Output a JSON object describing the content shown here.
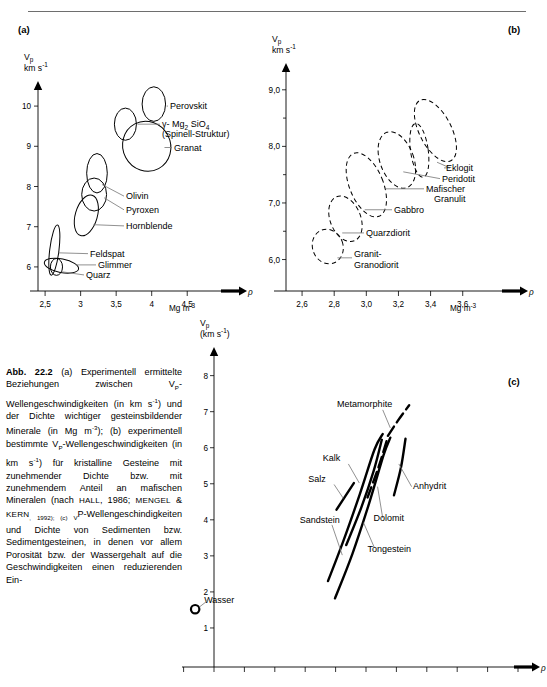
{
  "figure": {
    "number": "Abb. 22.2",
    "panels": [
      "(a)",
      "(b)",
      "(c)"
    ]
  },
  "caption": {
    "label": "Abb. 22.2",
    "text_runs": [
      "(a) Experimentell ermittelte Beziehungen zwischen V",
      "P",
      "-Wellengeschwindigkeiten (in km s",
      "-1",
      ") und der Dichte wichtiger gesteinsbildender Minerale (in Mg m",
      "-3",
      "); (b) experimentell bestimmte V",
      "P",
      "-Wellengeschwindigkeiten (in km s",
      "-1",
      ") für kristalline Gesteine mit zunehmender Dichte bzw. mit zunehmendem Anteil an mafischen Mineralen (nach ",
      "Hall",
      ", 1986; ",
      "Mengel",
      " & ",
      "Kern",
      ", 1992); (c) V",
      "P",
      "-Wellengeschindigkeiten und Dichte von Sedimenten bzw. Sedimentgesteinen, in denen vor allem Porosität bzw. der Wassergehalt auf die Geschwindigkeiten einen reduzierenden Ein-"
    ]
  },
  "chart_data": [
    {
      "id": "a",
      "type": "scatter",
      "panel_label": "(a)",
      "title": "",
      "ylabel": "Vp",
      "ylabel_unit": "km s-1",
      "xlabel": "ρ",
      "xlabel_unit": "Mg m-3",
      "xlim": [
        2.4,
        4.75
      ],
      "ylim": [
        5.55,
        10.45
      ],
      "xticks": [
        "2,5",
        "3",
        "3,5",
        "4",
        "4,5"
      ],
      "xtick_values": [
        2.5,
        3.0,
        3.5,
        4.0,
        4.5
      ],
      "yticks": [
        "6",
        "7",
        "8",
        "9",
        "10"
      ],
      "ytick_values": [
        6,
        7,
        8,
        9,
        10
      ],
      "grid": false,
      "legend": "inline-leader-labels",
      "envelopes": [
        {
          "name": "Perovskit",
          "cx": 4.03,
          "cy": 10.05,
          "rx": 0.165,
          "ry": 0.43,
          "rot": 0
        },
        {
          "name": "γ-Mg2SiO4",
          "cx": 3.63,
          "cy": 9.55,
          "rx": 0.155,
          "ry": 0.4,
          "rot": 0
        },
        {
          "name": "Granat",
          "cx": 3.93,
          "cy": 9.0,
          "rx": 0.335,
          "ry": 0.63,
          "rot": -28
        },
        {
          "name": "Olivin",
          "cx": 3.23,
          "cy": 8.33,
          "rx": 0.145,
          "ry": 0.49,
          "rot": 0
        },
        {
          "name": "Pyroxen",
          "cx": 3.19,
          "cy": 7.8,
          "rx": 0.175,
          "ry": 0.41,
          "rot": 0
        },
        {
          "name": "Hornblende",
          "cx": 3.08,
          "cy": 7.28,
          "rx": 0.155,
          "ry": 0.52,
          "rot": 16
        },
        {
          "name": "Feldspat",
          "cx": 2.63,
          "cy": 6.42,
          "rx": 0.065,
          "ry": 0.63,
          "rot": 7
        },
        {
          "name": "Glimmer",
          "cx": 2.73,
          "cy": 6.03,
          "rx": 0.245,
          "ry": 0.17,
          "rot": 11
        },
        {
          "name": "Quarz",
          "cx": 2.66,
          "cy": 6.0,
          "rx": 0.085,
          "ry": 0.21,
          "rot": 0
        }
      ]
    },
    {
      "id": "b",
      "type": "scatter",
      "panel_label": "(b)",
      "title": "",
      "ylabel": "Vp",
      "ylabel_unit": "km s-1",
      "xlabel": "ρ",
      "xlabel_unit": "Mg m-3",
      "xlim": [
        2.5,
        3.72
      ],
      "ylim": [
        5.55,
        9.35
      ],
      "xticks": [
        "2,6",
        "2,8",
        "3,0",
        "3,2",
        "3,4",
        "3,6"
      ],
      "xtick_values": [
        2.6,
        2.8,
        3.0,
        3.2,
        3.4,
        3.6
      ],
      "yticks": [
        "6,0",
        "7,0",
        "8,0",
        "9,0"
      ],
      "ytick_values": [
        6.0,
        7.0,
        8.0,
        9.0
      ],
      "grid": false,
      "legend": "inline-leader-labels",
      "envelopes": [
        {
          "name": "Eklogit",
          "cx": 3.43,
          "cy": 8.28,
          "rx": 0.1,
          "ry": 0.6,
          "rot": -27
        },
        {
          "name": "Peridotit",
          "cx": 3.33,
          "cy": 7.93,
          "rx": 0.055,
          "ry": 0.48,
          "rot": -8
        },
        {
          "name": "Mafischer Granulit",
          "cx": 3.19,
          "cy": 7.76,
          "rx": 0.105,
          "ry": 0.52,
          "rot": -20
        },
        {
          "name": "Gabbro",
          "cx": 3.0,
          "cy": 7.32,
          "rx": 0.105,
          "ry": 0.6,
          "rot": -22
        },
        {
          "name": "Quarzdiorit",
          "cx": 2.87,
          "cy": 6.72,
          "rx": 0.095,
          "ry": 0.42,
          "rot": -22
        },
        {
          "name": "Granit-Granodiorit",
          "cx": 2.76,
          "cy": 6.23,
          "rx": 0.095,
          "ry": 0.31,
          "rot": -20
        }
      ]
    },
    {
      "id": "c",
      "type": "line",
      "panel_label": "(c)",
      "title": "",
      "ylabel": "Vp",
      "ylabel_unit": "(km s-1)",
      "xlabel": "ρ",
      "xlabel_unit": "",
      "xlim": [
        0,
        10
      ],
      "ylim": [
        0,
        8.6
      ],
      "xticks": [],
      "yticks": [
        "1",
        "2",
        "3",
        "4",
        "5",
        "6",
        "7",
        "8"
      ],
      "ytick_values": [
        1,
        2,
        3,
        4,
        5,
        6,
        7,
        8
      ],
      "grid": false,
      "legend": "inline-leader-labels",
      "curves": [
        {
          "name": "Metamorphite",
          "dashed": true,
          "points": [
            [
              5.72,
              6.33
            ],
            [
              6.05,
              6.75
            ],
            [
              6.42,
              7.18
            ]
          ]
        },
        {
          "name": "Kalk",
          "dashed": false,
          "points": [
            [
              4.35,
              3.3
            ],
            [
              4.85,
              4.35
            ],
            [
              5.25,
              5.35
            ],
            [
              5.52,
              6.22
            ]
          ]
        },
        {
          "name": "Dolomit",
          "dashed": true,
          "points": [
            [
              5.05,
              4.62
            ],
            [
              5.42,
              5.48
            ],
            [
              5.7,
              6.25
            ]
          ]
        },
        {
          "name": "Salz",
          "dashed": false,
          "points": [
            [
              4.03,
              4.28
            ],
            [
              4.6,
              5.02
            ]
          ]
        },
        {
          "name": "Anhydrit",
          "dashed": false,
          "points": [
            [
              5.92,
              4.68
            ],
            [
              6.15,
              5.45
            ],
            [
              6.3,
              6.25
            ]
          ]
        },
        {
          "name": "Sandstein",
          "dashed": false,
          "points": [
            [
              3.75,
              2.3
            ],
            [
              4.25,
              3.4
            ],
            [
              4.8,
              4.72
            ],
            [
              5.28,
              5.95
            ],
            [
              5.55,
              6.38
            ]
          ]
        },
        {
          "name": "Tongestein",
          "dashed": false,
          "points": [
            [
              3.98,
              1.82
            ],
            [
              4.55,
              3.05
            ],
            [
              5.1,
              4.45
            ],
            [
              5.58,
              5.8
            ],
            [
              5.8,
              6.28
            ]
          ]
        }
      ],
      "points": [
        {
          "name": "Wasser",
          "x": -0.62,
          "y": 1.52,
          "marker": "open-circle"
        }
      ]
    }
  ]
}
